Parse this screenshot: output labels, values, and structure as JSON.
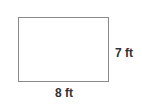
{
  "diagram": {
    "shape": "rectangle",
    "width_label": "8 ft",
    "height_label": "7 ft",
    "stroke_color": "#8a8a8a",
    "text_color": "#333333"
  }
}
